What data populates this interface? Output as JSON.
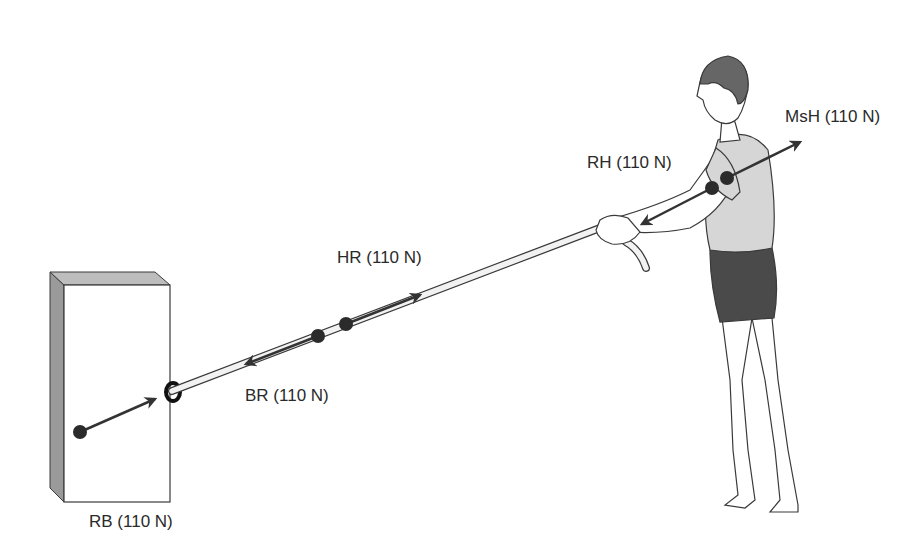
{
  "figure": {
    "colors": {
      "outline": "#3a3a3a",
      "block_face": "#ffffff",
      "block_side": "#9a9a9a",
      "block_top": "#bdbdbd",
      "rope": "#f2f2f2",
      "arrow": "#333333",
      "dot": "#2b2b2b",
      "hair": "#666666",
      "shirt": "#d6d6d6",
      "shorts": "#4a4a4a"
    }
  },
  "labels": {
    "rb": "RB (110 N)",
    "br": "BR (110 N)",
    "hr": "HR (110 N)",
    "rh": "RH (110 N)",
    "msh": "MsH (110 N)"
  },
  "forces": [
    {
      "id": "RB",
      "magnitude": "110 N",
      "on": "block",
      "direction": "toward rope"
    },
    {
      "id": "BR",
      "magnitude": "110 N",
      "on": "rope",
      "direction": "toward block"
    },
    {
      "id": "HR",
      "magnitude": "110 N",
      "on": "rope",
      "direction": "toward hand"
    },
    {
      "id": "RH",
      "magnitude": "110 N",
      "on": "hand",
      "direction": "toward rope"
    },
    {
      "id": "MsH",
      "magnitude": "110 N",
      "on": "hand",
      "direction": "toward shoulder"
    }
  ]
}
